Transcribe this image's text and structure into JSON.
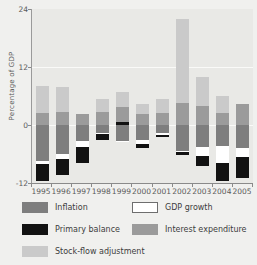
{
  "chart_data": {
    "type": "bar",
    "title": "",
    "subtitle": "",
    "xlabel": "",
    "ylabel": "Percentage of GDP",
    "ylim": [
      -12,
      24
    ],
    "yticks": [
      24,
      12,
      0,
      -12
    ],
    "grid": true,
    "stacked": true,
    "legend_position": "bottom",
    "categories": [
      "1995",
      "1996",
      "1997",
      "1998",
      "1999",
      "2000",
      "2001",
      "2002",
      "2003",
      "2004",
      "2005"
    ],
    "series": [
      {
        "name": "Inflation",
        "color": "#7e7e7e",
        "values": [
          -7.5,
          -6.0,
          -3.3,
          -1.7,
          -3.3,
          -3.1,
          -1.6,
          -5.3,
          -4.5,
          -4.3,
          -4.7
        ]
      },
      {
        "name": "GDP growth",
        "color": "#ffffff",
        "values": [
          -0.6,
          -1.0,
          -1.2,
          -0.2,
          -0.2,
          -0.8,
          -0.4,
          -0.3,
          -2.0,
          -3.5,
          -2.0
        ]
      },
      {
        "name": "Primary balance",
        "color": "#121212",
        "values": [
          -3.4,
          -3.3,
          -3.3,
          -1.3,
          0.6,
          -0.9,
          -0.4,
          -0.7,
          -2.0,
          -3.7,
          -4.3
        ]
      },
      {
        "name": "Interest expenditure",
        "color": "#9b9b9b",
        "values": [
          2.5,
          2.6,
          2.2,
          2.6,
          3.2,
          2.2,
          2.5,
          4.5,
          4.0,
          2.5,
          4.3
        ]
      },
      {
        "name": "Stock-flow adjustment",
        "color": "#cacaca",
        "values": [
          5.5,
          5.2,
          0.0,
          2.7,
          3.1,
          2.1,
          2.8,
          17.5,
          6.0,
          3.5,
          0.0
        ]
      }
    ],
    "legend_entries": [
      {
        "label": "Inflation",
        "color": "#7e7e7e"
      },
      {
        "label": "GDP growth",
        "color": "#ffffff"
      },
      {
        "label": "Primary balance",
        "color": "#121212"
      },
      {
        "label": "Interest expenditure",
        "color": "#9b9b9b"
      },
      {
        "label": "Stock-flow adjustment",
        "color": "#cacaca"
      }
    ]
  },
  "axis": {
    "y_title": "Percentage of GDP",
    "y_tick_labels": [
      "24",
      "12",
      "0",
      "-12"
    ],
    "x_tick_labels": [
      "1995",
      "1996",
      "1997",
      "1998",
      "1999",
      "2000",
      "2001",
      "2002",
      "2003",
      "2004",
      "2005"
    ]
  },
  "legend": {
    "inflation": "Inflation",
    "gdp_growth": "GDP growth",
    "primary_balance": "Primary balance",
    "interest_expenditure": "Interest expenditure",
    "stock_flow_adjustment": "Stock-flow adjustment"
  },
  "colors": {
    "inflation": "#7e7e7e",
    "gdp_growth": "#ffffff",
    "primary_balance": "#121212",
    "interest_expenditure": "#9b9b9b",
    "stock_flow_adjustment": "#cacaca",
    "plot_background": "#e9e9e6",
    "page_background": "#f0f0ee",
    "gridline": "#fafaf8"
  }
}
